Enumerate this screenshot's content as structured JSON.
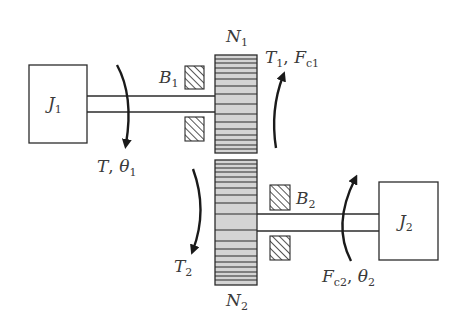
{
  "diagram": {
    "colors": {
      "stroke": "#2b2b2b",
      "gear_fill": "#d4d4d4",
      "background": "#ffffff",
      "text": "#3a3a3a"
    },
    "components": {
      "inertia_1": {
        "symbol": "J",
        "sub": "1"
      },
      "inertia_2": {
        "symbol": "J",
        "sub": "2"
      },
      "bearing_1": {
        "symbol": "B",
        "sub": "1"
      },
      "bearing_2": {
        "symbol": "B",
        "sub": "2"
      },
      "gear_1": {
        "symbol": "N",
        "sub": "1"
      },
      "gear_2": {
        "symbol": "N",
        "sub": "2"
      }
    },
    "annotations": {
      "input_torque": {
        "a": "T",
        "sep": ", ",
        "b": "θ",
        "b_sub": "1"
      },
      "gear1_reaction": {
        "a": "T",
        "a_sub": "1",
        "sep": ", ",
        "b": "F",
        "b_sub": "c1"
      },
      "gear2_torque": {
        "a": "T",
        "a_sub": "2"
      },
      "output": {
        "a": "F",
        "a_sub": "c2",
        "sep": ", ",
        "b": "θ",
        "b_sub": "2"
      }
    },
    "arrows": [
      {
        "name": "input-torque-arrow",
        "direction": "down"
      },
      {
        "name": "gear1-torque-arrow",
        "direction": "up"
      },
      {
        "name": "gear2-torque-arrow",
        "direction": "down"
      },
      {
        "name": "output-arrow",
        "direction": "up"
      }
    ]
  }
}
